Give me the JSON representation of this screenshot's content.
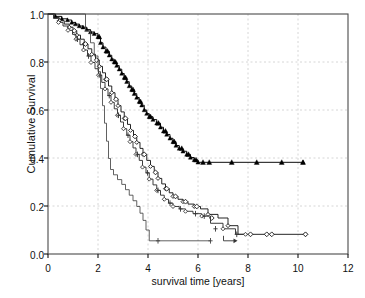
{
  "chart_data": {
    "type": "line",
    "subtype": "kaplan-meier-step",
    "title": "",
    "xlabel": "survival time [years]",
    "ylabel": "Cumulative Survival",
    "xlim": [
      0,
      12
    ],
    "ylim": [
      0.0,
      1.0
    ],
    "xticks": [
      0,
      2,
      4,
      6,
      8,
      10,
      12
    ],
    "xticklabels": [
      "0",
      "2",
      "4",
      "6",
      "8",
      "10",
      "12"
    ],
    "yticks": [
      0.0,
      0.2,
      0.4,
      0.6,
      0.8,
      1.0
    ],
    "yticklabels": [
      "0.0",
      "0.2",
      "0.4",
      "0.6",
      "0.8",
      "1.0"
    ],
    "grid": true,
    "grid_style": "dashed",
    "grid_color": "#cccccc",
    "legend": "none",
    "frame": true,
    "series": [
      {
        "name": "group-triangle",
        "marker": "filled-triangle",
        "color": "#000000",
        "censor_marker": "triangle",
        "steps": [
          [
            0.0,
            1.0
          ],
          [
            0.3,
            0.99
          ],
          [
            0.55,
            0.98
          ],
          [
            0.78,
            0.975
          ],
          [
            0.95,
            0.965
          ],
          [
            1.1,
            0.958
          ],
          [
            1.25,
            0.95
          ],
          [
            1.4,
            0.945
          ],
          [
            1.55,
            0.935
          ],
          [
            1.7,
            0.925
          ],
          [
            1.85,
            0.918
          ],
          [
            2.0,
            0.905
          ],
          [
            2.1,
            0.88
          ],
          [
            2.2,
            0.862
          ],
          [
            2.32,
            0.845
          ],
          [
            2.45,
            0.828
          ],
          [
            2.55,
            0.812
          ],
          [
            2.65,
            0.8
          ],
          [
            2.75,
            0.785
          ],
          [
            2.85,
            0.77
          ],
          [
            2.95,
            0.752
          ],
          [
            3.05,
            0.735
          ],
          [
            3.15,
            0.718
          ],
          [
            3.25,
            0.7
          ],
          [
            3.35,
            0.685
          ],
          [
            3.45,
            0.668
          ],
          [
            3.55,
            0.652
          ],
          [
            3.65,
            0.635
          ],
          [
            3.75,
            0.62
          ],
          [
            3.85,
            0.6
          ],
          [
            3.95,
            0.585
          ],
          [
            4.05,
            0.572
          ],
          [
            4.2,
            0.56
          ],
          [
            4.35,
            0.545
          ],
          [
            4.5,
            0.528
          ],
          [
            4.62,
            0.512
          ],
          [
            4.75,
            0.498
          ],
          [
            4.88,
            0.482
          ],
          [
            5.0,
            0.468
          ],
          [
            5.12,
            0.452
          ],
          [
            5.25,
            0.44
          ],
          [
            5.4,
            0.428
          ],
          [
            5.55,
            0.415
          ],
          [
            5.7,
            0.402
          ],
          [
            5.85,
            0.392
          ],
          [
            6.0,
            0.382
          ],
          [
            10.2,
            0.382
          ]
        ],
        "censored": [
          [
            2.05,
            0.905
          ],
          [
            2.38,
            0.845
          ],
          [
            2.7,
            0.8
          ],
          [
            3.1,
            0.735
          ],
          [
            3.4,
            0.685
          ],
          [
            3.7,
            0.635
          ],
          [
            4.1,
            0.572
          ],
          [
            4.42,
            0.545
          ],
          [
            4.7,
            0.512
          ],
          [
            5.05,
            0.468
          ],
          [
            5.35,
            0.44
          ],
          [
            5.62,
            0.415
          ],
          [
            5.92,
            0.392
          ],
          [
            6.2,
            0.382
          ],
          [
            6.45,
            0.382
          ],
          [
            7.35,
            0.382
          ],
          [
            8.35,
            0.382
          ],
          [
            9.35,
            0.382
          ],
          [
            10.2,
            0.382
          ]
        ]
      },
      {
        "name": "group-open-diamond-a",
        "marker": "open-diamond",
        "color": "#1a1a1a",
        "censor_marker": "diamond",
        "steps": [
          [
            0.0,
            1.0
          ],
          [
            0.25,
            0.985
          ],
          [
            0.45,
            0.972
          ],
          [
            0.65,
            0.958
          ],
          [
            0.85,
            0.945
          ],
          [
            1.0,
            0.93
          ],
          [
            1.15,
            0.912
          ],
          [
            1.3,
            0.895
          ],
          [
            1.45,
            0.875
          ],
          [
            1.6,
            0.855
          ],
          [
            1.75,
            0.832
          ],
          [
            1.9,
            0.808
          ],
          [
            2.05,
            0.782
          ],
          [
            2.18,
            0.755
          ],
          [
            2.3,
            0.728
          ],
          [
            2.42,
            0.7
          ],
          [
            2.55,
            0.672
          ],
          [
            2.68,
            0.645
          ],
          [
            2.8,
            0.618
          ],
          [
            2.92,
            0.592
          ],
          [
            3.05,
            0.565
          ],
          [
            3.18,
            0.54
          ],
          [
            3.3,
            0.515
          ],
          [
            3.42,
            0.49
          ],
          [
            3.55,
            0.465
          ],
          [
            3.68,
            0.44
          ],
          [
            3.8,
            0.415
          ],
          [
            3.95,
            0.39
          ],
          [
            4.1,
            0.365
          ],
          [
            4.25,
            0.34
          ],
          [
            4.4,
            0.315
          ],
          [
            4.55,
            0.292
          ],
          [
            4.7,
            0.272
          ],
          [
            4.85,
            0.255
          ],
          [
            5.0,
            0.24
          ],
          [
            5.2,
            0.228
          ],
          [
            5.4,
            0.218
          ],
          [
            5.6,
            0.208
          ],
          [
            5.85,
            0.198
          ],
          [
            6.1,
            0.188
          ],
          [
            6.4,
            0.165
          ],
          [
            6.8,
            0.15
          ],
          [
            7.2,
            0.118
          ],
          [
            7.6,
            0.082
          ],
          [
            10.3,
            0.082
          ]
        ],
        "censored": [
          [
            1.05,
            0.93
          ],
          [
            1.5,
            0.875
          ],
          [
            1.95,
            0.808
          ],
          [
            2.35,
            0.728
          ],
          [
            2.72,
            0.645
          ],
          [
            3.1,
            0.565
          ],
          [
            3.48,
            0.49
          ],
          [
            3.85,
            0.415
          ],
          [
            4.3,
            0.34
          ],
          [
            4.75,
            0.272
          ],
          [
            5.1,
            0.24
          ],
          [
            5.5,
            0.218
          ],
          [
            5.95,
            0.198
          ],
          [
            6.55,
            0.15
          ],
          [
            8.1,
            0.082
          ],
          [
            8.75,
            0.082
          ],
          [
            8.95,
            0.082
          ],
          [
            10.3,
            0.082
          ]
        ]
      },
      {
        "name": "group-open-diamond-b",
        "marker": "open-diamond",
        "color": "#333333",
        "censor_marker": "plus",
        "steps": [
          [
            0.0,
            1.0
          ],
          [
            0.22,
            0.982
          ],
          [
            0.42,
            0.965
          ],
          [
            0.6,
            0.95
          ],
          [
            0.8,
            0.932
          ],
          [
            0.98,
            0.915
          ],
          [
            1.12,
            0.895
          ],
          [
            1.28,
            0.872
          ],
          [
            1.42,
            0.85
          ],
          [
            1.58,
            0.825
          ],
          [
            1.72,
            0.798
          ],
          [
            1.88,
            0.772
          ],
          [
            2.02,
            0.745
          ],
          [
            2.15,
            0.715
          ],
          [
            2.28,
            0.688
          ],
          [
            2.4,
            0.66
          ],
          [
            2.52,
            0.632
          ],
          [
            2.65,
            0.605
          ],
          [
            2.78,
            0.578
          ],
          [
            2.9,
            0.55
          ],
          [
            3.02,
            0.522
          ],
          [
            3.15,
            0.495
          ],
          [
            3.28,
            0.468
          ],
          [
            3.4,
            0.442
          ],
          [
            3.52,
            0.415
          ],
          [
            3.65,
            0.39
          ],
          [
            3.78,
            0.362
          ],
          [
            3.92,
            0.338
          ],
          [
            4.05,
            0.312
          ],
          [
            4.2,
            0.288
          ],
          [
            4.35,
            0.265
          ],
          [
            4.5,
            0.245
          ],
          [
            4.65,
            0.228
          ],
          [
            4.82,
            0.212
          ],
          [
            5.0,
            0.198
          ],
          [
            5.25,
            0.188
          ],
          [
            5.5,
            0.178
          ],
          [
            5.8,
            0.168
          ],
          [
            6.15,
            0.158
          ],
          [
            6.5,
            0.128
          ],
          [
            7.0,
            0.105
          ],
          [
            7.5,
            0.082
          ],
          [
            7.9,
            0.082
          ]
        ],
        "censored": [
          [
            1.18,
            0.895
          ],
          [
            1.62,
            0.825
          ],
          [
            2.08,
            0.745
          ],
          [
            2.45,
            0.66
          ],
          [
            2.82,
            0.578
          ],
          [
            3.2,
            0.495
          ],
          [
            3.58,
            0.415
          ],
          [
            3.98,
            0.338
          ],
          [
            4.4,
            0.265
          ],
          [
            4.88,
            0.212
          ],
          [
            5.3,
            0.188
          ],
          [
            5.9,
            0.168
          ],
          [
            6.25,
            0.158
          ],
          [
            6.7,
            0.105
          ],
          [
            7.55,
            0.082
          ]
        ]
      },
      {
        "name": "group-plain-step",
        "marker": "none",
        "color": "#444444",
        "censor_marker": "plus",
        "steps": [
          [
            0.0,
            1.0
          ],
          [
            1.35,
            1.0
          ],
          [
            1.5,
            0.93
          ],
          [
            1.7,
            0.88
          ],
          [
            1.85,
            0.825
          ],
          [
            2.0,
            0.76
          ],
          [
            2.1,
            0.69
          ],
          [
            2.18,
            0.618
          ],
          [
            2.26,
            0.545
          ],
          [
            2.34,
            0.47
          ],
          [
            2.42,
            0.398
          ],
          [
            2.5,
            0.352
          ],
          [
            2.62,
            0.33
          ],
          [
            2.78,
            0.31
          ],
          [
            2.95,
            0.29
          ],
          [
            3.1,
            0.268
          ],
          [
            3.25,
            0.245
          ],
          [
            3.4,
            0.222
          ],
          [
            3.55,
            0.198
          ],
          [
            3.68,
            0.17
          ],
          [
            3.8,
            0.14
          ],
          [
            3.92,
            0.1
          ],
          [
            4.05,
            0.055
          ],
          [
            6.5,
            0.055
          ]
        ],
        "censored": [
          [
            4.4,
            0.055
          ],
          [
            6.5,
            0.055
          ]
        ]
      }
    ],
    "annotations": [
      {
        "text": "arrow-right",
        "x": 7.3,
        "y": 0.055,
        "type": "censor-arrow"
      }
    ]
  },
  "axes": {
    "x_tick_labels": [
      "0",
      "2",
      "4",
      "6",
      "8",
      "10",
      "12"
    ],
    "y_tick_labels": [
      "0.0",
      "0.2",
      "0.4",
      "0.6",
      "0.8",
      "1.0"
    ],
    "x_axis_title": "survival time [years]",
    "y_axis_title": "Cumulative Survival"
  },
  "style": {
    "background": "#ffffff",
    "frame_color": "#4a4a4a",
    "grid_color": "#cccccc",
    "text_color": "#111111"
  }
}
